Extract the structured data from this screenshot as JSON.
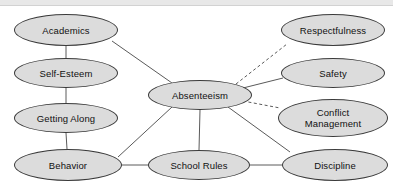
{
  "diagram": {
    "canvas": {
      "width": 393,
      "height": 184,
      "background": "#ffffff"
    },
    "topbar": {
      "color": "#e8e8e8"
    },
    "style": {
      "node_fill": "#dcdcdc",
      "node_stroke": "#3a3a3a",
      "edge_color": "#5a5a5a",
      "text_color": "#111111"
    },
    "nodes": [
      {
        "id": "academics",
        "label": "Academics",
        "cx": 66,
        "cy": 30,
        "rx": 52,
        "ry": 16
      },
      {
        "id": "self_esteem",
        "label": "Self-Esteem",
        "cx": 66,
        "cy": 73,
        "rx": 52,
        "ry": 15
      },
      {
        "id": "getting",
        "label": "Getting Along",
        "cx": 66,
        "cy": 118,
        "rx": 52,
        "ry": 15
      },
      {
        "id": "behavior",
        "label": "Behavior",
        "cx": 68,
        "cy": 165,
        "rx": 54,
        "ry": 16
      },
      {
        "id": "absenteeism",
        "label": "Absenteeism",
        "cx": 200,
        "cy": 95,
        "rx": 52,
        "ry": 15
      },
      {
        "id": "school",
        "label": "School Rules",
        "cx": 199,
        "cy": 165,
        "rx": 51,
        "ry": 15
      },
      {
        "id": "respect",
        "label": "Respectfulness",
        "cx": 333,
        "cy": 30,
        "rx": 52,
        "ry": 16
      },
      {
        "id": "safety",
        "label": "Safety",
        "cx": 333,
        "cy": 73,
        "rx": 52,
        "ry": 15
      },
      {
        "id": "conflict",
        "label": "Conflict\nManagement",
        "cx": 333,
        "cy": 118,
        "rx": 55,
        "ry": 19
      },
      {
        "id": "discipline",
        "label": "Discipline",
        "cx": 335,
        "cy": 165,
        "rx": 53,
        "ry": 16
      }
    ],
    "edges": [
      {
        "from": "academics",
        "to": "self_esteem",
        "style": "solid",
        "x1": 66,
        "y1": 46,
        "x2": 66,
        "y2": 58
      },
      {
        "from": "self_esteem",
        "to": "getting",
        "style": "solid",
        "x1": 66,
        "y1": 88,
        "x2": 66,
        "y2": 103
      },
      {
        "from": "getting",
        "to": "behavior",
        "style": "solid",
        "x1": 66,
        "y1": 133,
        "x2": 67,
        "y2": 149
      },
      {
        "from": "academics",
        "to": "absenteeism",
        "style": "solid",
        "x1": 112,
        "y1": 41,
        "x2": 172,
        "y2": 83
      },
      {
        "from": "behavior",
        "to": "absenteeism",
        "style": "solid",
        "x1": 118,
        "y1": 157,
        "x2": 172,
        "y2": 107
      },
      {
        "from": "behavior",
        "to": "school",
        "style": "solid",
        "x1": 122,
        "y1": 165,
        "x2": 148,
        "y2": 165
      },
      {
        "from": "absenteeism",
        "to": "school",
        "style": "solid",
        "x1": 200,
        "y1": 110,
        "x2": 199,
        "y2": 150
      },
      {
        "from": "school",
        "to": "discipline",
        "style": "solid",
        "x1": 250,
        "y1": 165,
        "x2": 282,
        "y2": 165
      },
      {
        "from": "absenteeism",
        "to": "discipline",
        "style": "solid",
        "x1": 228,
        "y1": 107,
        "x2": 290,
        "y2": 152
      },
      {
        "from": "absenteeism",
        "to": "safety",
        "style": "solid",
        "x1": 243,
        "y1": 88,
        "x2": 283,
        "y2": 78
      },
      {
        "from": "absenteeism",
        "to": "respect",
        "style": "dashed",
        "x1": 236,
        "y1": 84,
        "x2": 287,
        "y2": 44
      },
      {
        "from": "absenteeism",
        "to": "conflict",
        "style": "dashed",
        "x1": 243,
        "y1": 101,
        "x2": 280,
        "y2": 108
      }
    ]
  }
}
